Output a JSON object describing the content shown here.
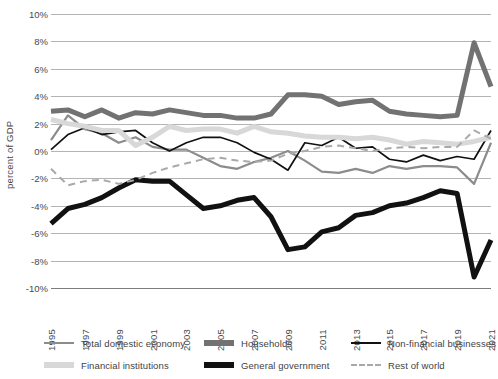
{
  "chart_data": {
    "type": "line",
    "title": "",
    "xlabel": "",
    "ylabel": "percent of GDP",
    "ylim": [
      -10,
      10
    ],
    "xlim": [
      1995,
      2021
    ],
    "grid": true,
    "legend_position": "bottom",
    "y_ticks": [
      "10%",
      "8%",
      "6%",
      "4%",
      "2%",
      "0%",
      "-2%",
      "-4%",
      "-6%",
      "-8%",
      "-10%"
    ],
    "y_tick_values": [
      10,
      8,
      6,
      4,
      2,
      0,
      -2,
      -4,
      -6,
      -8,
      -10
    ],
    "x_tick_labels": [
      "1995",
      "1997",
      "1999",
      "2001",
      "2003",
      "2005",
      "2007",
      "2009",
      "2011",
      "2013",
      "2015",
      "2017",
      "2019",
      "2021"
    ],
    "x_tick_values": [
      1995,
      1997,
      1999,
      2001,
      2003,
      2005,
      2007,
      2009,
      2011,
      2013,
      2015,
      2017,
      2019,
      2021
    ],
    "x": [
      1995,
      1996,
      1997,
      1998,
      1999,
      2000,
      2001,
      2002,
      2003,
      2004,
      2005,
      2006,
      2007,
      2008,
      2009,
      2010,
      2011,
      2012,
      2013,
      2014,
      2015,
      2016,
      2017,
      2018,
      2019,
      2020,
      2021
    ],
    "series": [
      {
        "name": "Total domestic economy",
        "color": "#8c8c8c",
        "width": 2.2,
        "dash": "none",
        "values": [
          0.8,
          2.6,
          1.6,
          1.3,
          0.6,
          1.0,
          0.3,
          0.1,
          0.1,
          -0.5,
          -1.1,
          -1.3,
          -0.8,
          -0.5,
          0.0,
          -0.7,
          -1.5,
          -1.6,
          -1.3,
          -1.6,
          -1.1,
          -1.3,
          -1.1,
          -1.1,
          -1.2,
          -2.4,
          0.6
        ]
      },
      {
        "name": "Households",
        "color": "#727272",
        "width": 5.0,
        "dash": "none",
        "values": [
          2.9,
          3.0,
          2.5,
          3.0,
          2.4,
          2.8,
          2.7,
          3.0,
          2.8,
          2.6,
          2.6,
          2.4,
          2.4,
          2.7,
          4.1,
          4.1,
          4.0,
          3.4,
          3.6,
          3.7,
          2.9,
          2.7,
          2.6,
          2.5,
          2.6,
          7.9,
          4.7
        ]
      },
      {
        "name": "Non-financial businesses",
        "color": "#111111",
        "width": 1.7,
        "dash": "none",
        "values": [
          0.1,
          1.2,
          1.7,
          1.2,
          1.4,
          1.5,
          0.6,
          0.0,
          0.6,
          1.0,
          1.0,
          0.6,
          -0.1,
          -0.6,
          -1.4,
          0.6,
          0.4,
          1.0,
          0.2,
          0.3,
          -0.6,
          -0.8,
          -0.3,
          -0.7,
          -0.4,
          -0.6,
          1.5
        ]
      },
      {
        "name": "Financial institutions",
        "color": "#d8d8d8",
        "width": 5.0,
        "dash": "none",
        "values": [
          2.3,
          2.0,
          1.8,
          1.5,
          1.5,
          0.4,
          1.0,
          1.8,
          1.5,
          1.6,
          1.6,
          1.3,
          1.8,
          1.4,
          1.3,
          1.1,
          1.0,
          1.0,
          0.9,
          1.0,
          0.8,
          0.5,
          0.7,
          0.6,
          0.5,
          0.7,
          1.0
        ]
      },
      {
        "name": "General government",
        "color": "#111111",
        "width": 5.0,
        "dash": "none",
        "values": [
          -5.3,
          -4.2,
          -3.9,
          -3.4,
          -2.7,
          -2.1,
          -2.2,
          -2.2,
          -3.2,
          -4.2,
          -4.0,
          -3.6,
          -3.4,
          -4.8,
          -7.2,
          -7.0,
          -5.9,
          -5.6,
          -4.7,
          -4.5,
          -4.0,
          -3.8,
          -3.4,
          -2.9,
          -3.1,
          -9.2,
          -6.5
        ]
      },
      {
        "name": "Rest of world",
        "color": "#a9a9a9",
        "width": 2.0,
        "dash": "dashed",
        "values": [
          -1.3,
          -2.5,
          -2.2,
          -2.1,
          -2.4,
          -2.1,
          -1.6,
          -1.2,
          -0.9,
          -0.6,
          -0.5,
          -0.7,
          -0.8,
          -0.7,
          -0.2,
          0.0,
          0.3,
          0.4,
          0.2,
          0.0,
          0.2,
          0.3,
          0.2,
          0.3,
          0.3,
          1.5,
          0.9
        ]
      }
    ]
  },
  "legend": {
    "items": [
      {
        "label": "Total domestic economy",
        "style": "thin",
        "color": "#8c8c8c"
      },
      {
        "label": "Households",
        "style": "thick",
        "color": "#727272"
      },
      {
        "label": "Non-financial businesses",
        "style": "thin",
        "color": "#111111"
      },
      {
        "label": "Financial institutions",
        "style": "thick",
        "color": "#d8d8d8"
      },
      {
        "label": "General government",
        "style": "thick",
        "color": "#111111"
      },
      {
        "label": "Rest of world",
        "style": "dash",
        "color": "#a9a9a9"
      }
    ],
    "order": [
      0,
      1,
      2,
      3,
      4,
      5
    ]
  }
}
